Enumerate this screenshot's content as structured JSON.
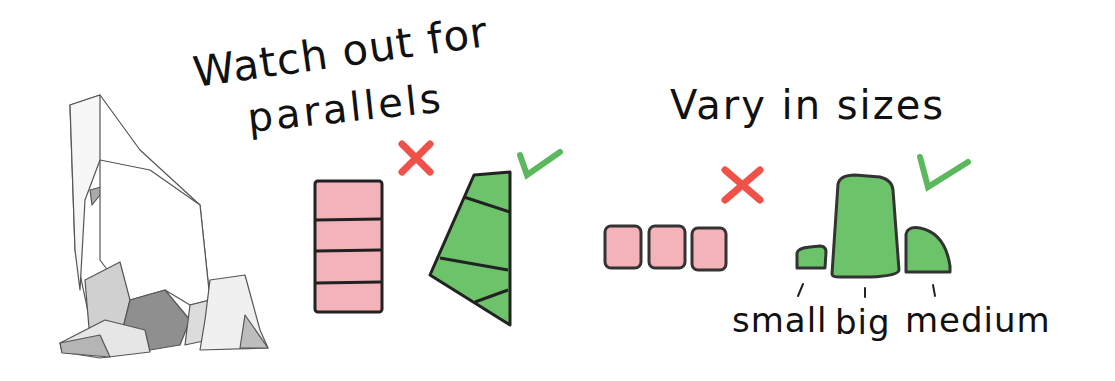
{
  "diagram": {
    "section_parallels": {
      "title_line1": "Watch out for",
      "title_line2": "parallels",
      "bad_mark": "cross-icon",
      "good_mark": "check-icon"
    },
    "section_sizes": {
      "title": "Vary in sizes",
      "bad_mark": "cross-icon",
      "good_mark": "check-icon",
      "labels": [
        "small",
        "big",
        "medium"
      ]
    },
    "colors": {
      "bad_fill": "#f4b3b8",
      "good_fill": "#6cc36a",
      "cross": "#f0524a",
      "check": "#5cb85c",
      "outline": "#222222",
      "rock_light": "#f2f2f2",
      "rock_mid": "#c8c8c8",
      "rock_dark": "#9a9a9a"
    }
  }
}
